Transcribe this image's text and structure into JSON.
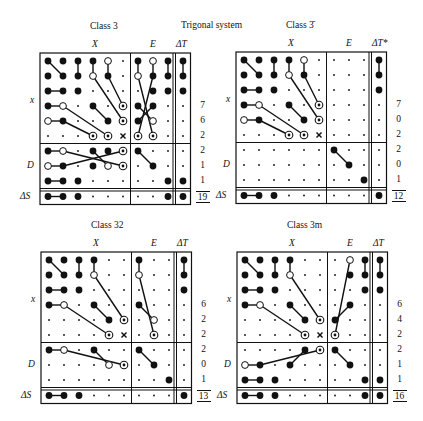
{
  "title": "Trigonal system",
  "col_headers": {
    "x": "X",
    "e": "E",
    "dt": "ΔT"
  },
  "row_labels": {
    "x": "x",
    "d": "D",
    "ds": "ΔS"
  },
  "symbols_legend": {
    "F": "filled dot",
    "O": "open circle",
    "C": "circled dot",
    "s": "small dot",
    "x": "cross",
    "-": "empty"
  },
  "panels": [
    {
      "id": "class-3",
      "title": "Class 3",
      "dt_label": "ΔT",
      "origin": [
        40,
        53
      ],
      "numbers": [
        "7",
        "6",
        "2",
        "2",
        "1",
        "1"
      ],
      "total": "19",
      "rows": [
        "FFFFOs|FOF|F",
        "FFFOFs|OFF|F",
        "FFFsss|sFF|F",
        "FOsFsC|FFs|s",
        "OFssFC|FOs|s",
        "sssCCx|CCs|s",
        "FOsFFC|Fss|s",
        "OFsFOC|sFs|s",
        "FFFsss|ssF|F",
        "FFFsss|ssF|F"
      ],
      "lines": [
        [
          0,
          0,
          1,
          1
        ],
        [
          0,
          2,
          1,
          2
        ],
        [
          0,
          3,
          1,
          3
        ],
        [
          0,
          4,
          1,
          5
        ],
        [
          1,
          3,
          5,
          5
        ],
        [
          2,
          0,
          2,
          1
        ],
        [
          3,
          0,
          3,
          1
        ],
        [
          3,
          3,
          4,
          4
        ],
        [
          3,
          1,
          5,
          4
        ],
        [
          4,
          0,
          4,
          1
        ],
        [
          4,
          1,
          5,
          3
        ],
        [
          0,
          6,
          1,
          6
        ],
        [
          0,
          7,
          5,
          6
        ],
        [
          1,
          6,
          5,
          7
        ],
        [
          0,
          8,
          1,
          8
        ],
        [
          3,
          6,
          5,
          7
        ],
        [
          4,
          6,
          4,
          7
        ],
        [
          0,
          9,
          1,
          9
        ],
        [
          6,
          0,
          6,
          1
        ],
        [
          6,
          0,
          7,
          1
        ],
        [
          6,
          3,
          7,
          4
        ],
        [
          6,
          4,
          7,
          5
        ],
        [
          7,
          0,
          6,
          1
        ],
        [
          0,
          11,
          1,
          11
        ],
        [
          0,
          11,
          1,
          11
        ]
      ],
      "segments": [
        [
          0,
          0,
          1,
          1
        ],
        [
          3,
          0,
          3,
          1
        ],
        [
          2,
          0,
          2,
          1
        ],
        [
          4,
          0,
          4,
          1
        ],
        [
          0,
          2,
          1,
          2
        ],
        [
          0,
          3,
          1,
          3
        ],
        [
          1,
          3,
          4,
          5
        ],
        [
          3,
          3,
          4,
          4
        ],
        [
          0,
          4,
          1,
          4
        ],
        [
          1,
          4,
          3,
          5
        ],
        [
          3,
          1,
          5,
          4
        ],
        [
          4,
          1,
          5,
          3
        ],
        [
          6,
          0,
          6,
          1
        ],
        [
          7,
          0,
          7,
          1
        ],
        [
          8,
          0,
          8,
          1
        ],
        [
          9,
          0,
          9,
          1
        ],
        [
          6,
          1,
          7,
          5
        ],
        [
          7,
          1,
          6,
          5
        ],
        [
          6,
          3,
          7,
          4
        ],
        [
          7,
          3,
          6,
          4
        ],
        [
          0,
          6,
          1,
          6
        ],
        [
          1,
          6,
          5,
          7
        ],
        [
          0,
          7,
          1,
          7
        ],
        [
          1,
          7,
          5,
          6
        ],
        [
          3,
          6,
          4,
          7
        ],
        [
          6,
          6,
          7,
          7
        ],
        [
          0,
          8,
          1,
          8
        ],
        [
          0,
          9,
          1,
          9
        ]
      ]
    },
    {
      "id": "class-3bar",
      "title": "Class 3̄",
      "dt_label": "ΔT*",
      "origin": [
        236,
        52
      ],
      "numbers": [
        "7",
        "0",
        "2",
        "2",
        "0",
        "1"
      ],
      "total": "12",
      "rows": [
        "FFFFOs|sss|F",
        "FFFOFs|sss|F",
        "FFFsss|sss|F",
        "FOsFsC|sss|s",
        "OFssFC|sss|s",
        "sssCCx|sss|s",
        "ssssss|Fss|s",
        "ssssss|sFs|s",
        "ssssss|ssF|s",
        "FFFsss|sss|F"
      ],
      "segments": [
        [
          0,
          0,
          1,
          1
        ],
        [
          2,
          0,
          2,
          1
        ],
        [
          3,
          0,
          3,
          1
        ],
        [
          4,
          0,
          4,
          1
        ],
        [
          0,
          2,
          1,
          2
        ],
        [
          0,
          3,
          1,
          3
        ],
        [
          1,
          3,
          4,
          5
        ],
        [
          3,
          3,
          4,
          4
        ],
        [
          0,
          4,
          1,
          4
        ],
        [
          1,
          4,
          3,
          5
        ],
        [
          3,
          1,
          5,
          4
        ],
        [
          4,
          1,
          5,
          3
        ],
        [
          9,
          0,
          9,
          1
        ],
        [
          6,
          6,
          7,
          7
        ],
        [
          0,
          9,
          1,
          9
        ]
      ]
    },
    {
      "id": "class-32",
      "title": "Class 32",
      "dt_label": "ΔT",
      "origin": [
        41,
        252
      ],
      "numbers": [
        "6",
        "2",
        "2",
        "2",
        "0",
        "1"
      ],
      "total": "13",
      "rows": [
        "FFFFss|Fss|F",
        "FFFOss|Oss|F",
        "FFFsss|sss|F",
        "FOsFss|Fss|s",
        "ssssFC|sOs|s",
        "ssssCx|sCs|s",
        "FOsFss|Fss|s",
        "ssssOC|sFs|s",
        "ssssss|ssF|s",
        "FFFsss|sss|F"
      ],
      "segments": [
        [
          0,
          0,
          1,
          1
        ],
        [
          2,
          0,
          2,
          1
        ],
        [
          3,
          0,
          3,
          1
        ],
        [
          0,
          2,
          1,
          2
        ],
        [
          0,
          3,
          1,
          3
        ],
        [
          1,
          3,
          4,
          5
        ],
        [
          3,
          3,
          4,
          4
        ],
        [
          3,
          1,
          5,
          4
        ],
        [
          6,
          0,
          6,
          1
        ],
        [
          6,
          1,
          7,
          5
        ],
        [
          6,
          3,
          7,
          4
        ],
        [
          9,
          0,
          9,
          1
        ],
        [
          0,
          6,
          1,
          6
        ],
        [
          1,
          6,
          5,
          7
        ],
        [
          3,
          6,
          4,
          7
        ],
        [
          6,
          6,
          7,
          7
        ],
        [
          0,
          9,
          1,
          9
        ]
      ]
    },
    {
      "id": "class-3m",
      "title": "Class 3m",
      "dt_label": "ΔT",
      "origin": [
        237,
        252
      ],
      "numbers": [
        "6",
        "4",
        "2",
        "2",
        "1",
        "1"
      ],
      "total": "16",
      "rows": [
        "FFFFss|sOF|F",
        "FFFOss|sFF|F",
        "FFFsss|ssF|F",
        "FOsFss|sFs|s",
        "ssssFC|Fss|s",
        "ssssCx|Css|s",
        "ssssFC|Fss|s",
        "OFsFss|sFs|s",
        "FFFsss|ssF|F",
        "FFFsss|ssF|F"
      ],
      "segments": [
        [
          0,
          0,
          1,
          1
        ],
        [
          2,
          0,
          2,
          1
        ],
        [
          3,
          0,
          3,
          1
        ],
        [
          0,
          2,
          1,
          2
        ],
        [
          0,
          3,
          1,
          3
        ],
        [
          1,
          3,
          4,
          5
        ],
        [
          3,
          3,
          4,
          4
        ],
        [
          3,
          1,
          5,
          4
        ],
        [
          7,
          0,
          6,
          5
        ],
        [
          7,
          3,
          6,
          4
        ],
        [
          8,
          0,
          8,
          1
        ],
        [
          9,
          0,
          9,
          1
        ],
        [
          0,
          7,
          1,
          7
        ],
        [
          1,
          7,
          5,
          6
        ],
        [
          3,
          7,
          4,
          6
        ],
        [
          6,
          6,
          7,
          7
        ],
        [
          0,
          8,
          1,
          8
        ],
        [
          0,
          9,
          1,
          9
        ]
      ]
    }
  ]
}
